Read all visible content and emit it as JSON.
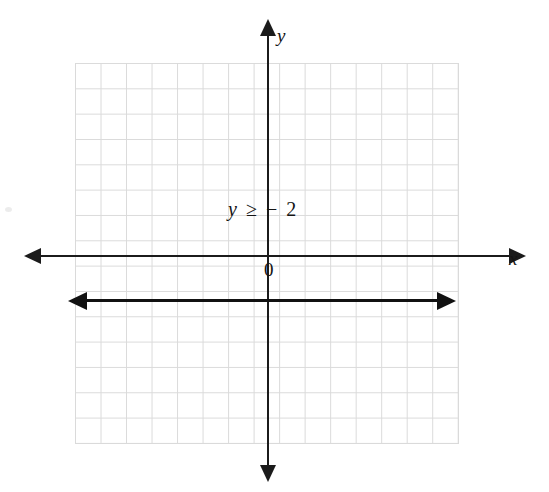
{
  "figure": {
    "kind": "coordinate-plane-inequality-graph",
    "background_color": "#ffffff",
    "grid_color": "#d9d9d9",
    "axis_color": "#1b1b1b",
    "line_color": "#111111"
  },
  "axes": {
    "x_label": "x",
    "y_label": "y",
    "origin_label": "0"
  },
  "annotation": {
    "variable": "y",
    "relation": "≥",
    "value": "− 2",
    "full_text": "y ≥ − 2"
  },
  "chart_data": {
    "type": "line",
    "title": "",
    "xlabel": "x",
    "ylabel": "y",
    "xlim": [
      -7.6,
      7.4
    ],
    "ylim": [
      -7.4,
      7.6
    ],
    "grid": true,
    "grid_step": 1,
    "grid_columns": 15,
    "grid_rows": 15,
    "legend": "none",
    "annotations": [
      {
        "text": "y ≥ − 2",
        "x": -0.3,
        "y": 1.8
      },
      {
        "text": "0",
        "x": 0.25,
        "y": -0.55
      }
    ],
    "series": [
      {
        "name": "y = -2 (boundary of y ≥ -2)",
        "type": "line",
        "style": "solid",
        "arrows": "both",
        "x": [
          -7.3,
          7.0
        ],
        "values": [
          -2,
          -2
        ]
      }
    ]
  }
}
